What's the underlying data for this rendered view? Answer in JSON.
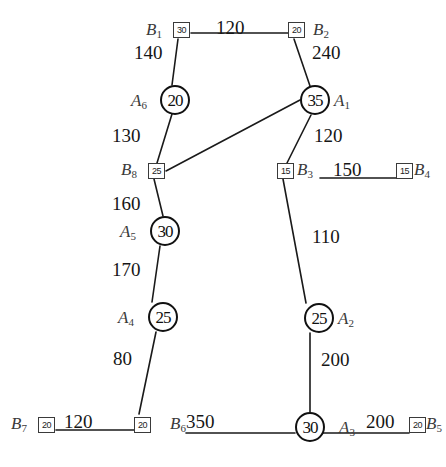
{
  "diagram": {
    "background_color": "#ffffff",
    "stroke_color": "#1a1a1a",
    "nodes": [
      {
        "id": "B1",
        "shape": "square",
        "label": "B",
        "sub": "1",
        "value": "30",
        "x": 173,
        "y": 22,
        "label_x": 146,
        "label_y": 21,
        "label_side": "left"
      },
      {
        "id": "B2",
        "shape": "square",
        "label": "B",
        "sub": "2",
        "value": "20",
        "x": 288,
        "y": 22,
        "label_x": 313,
        "label_y": 21,
        "label_side": "right"
      },
      {
        "id": "A6",
        "shape": "circle",
        "label": "A",
        "sub": "6",
        "value": "20",
        "x": 160,
        "y": 85,
        "label_x": 131,
        "label_y": 92,
        "label_side": "left"
      },
      {
        "id": "A1",
        "shape": "circle",
        "label": "A",
        "sub": "1",
        "value": "35",
        "x": 300,
        "y": 85,
        "label_x": 334,
        "label_y": 92,
        "label_side": "right"
      },
      {
        "id": "B8",
        "shape": "square",
        "label": "B",
        "sub": "8",
        "value": "25",
        "x": 148,
        "y": 163,
        "label_x": 121,
        "label_y": 161,
        "label_side": "left"
      },
      {
        "id": "B3",
        "shape": "square",
        "label": "B",
        "sub": "3",
        "value": "15",
        "x": 277,
        "y": 163,
        "label_x": 297,
        "label_y": 161,
        "label_side": "right"
      },
      {
        "id": "B4",
        "shape": "square",
        "label": "B",
        "sub": "4",
        "value": "15",
        "x": 396,
        "y": 163,
        "label_x": 414,
        "label_y": 161,
        "label_side": "right"
      },
      {
        "id": "A5",
        "shape": "circle",
        "label": "A",
        "sub": "5",
        "value": "30",
        "x": 150,
        "y": 216,
        "label_x": 120,
        "label_y": 223,
        "label_side": "left"
      },
      {
        "id": "A2",
        "shape": "circle",
        "label": "A",
        "sub": "2",
        "value": "25",
        "x": 304,
        "y": 303,
        "label_x": 338,
        "label_y": 310,
        "label_side": "right"
      },
      {
        "id": "A4",
        "shape": "circle",
        "label": "A",
        "sub": "4",
        "value": "25",
        "x": 148,
        "y": 302,
        "label_x": 118,
        "label_y": 309,
        "label_side": "left"
      },
      {
        "id": "B7",
        "shape": "square",
        "label": "B",
        "sub": "7",
        "value": "20",
        "x": 38,
        "y": 417,
        "label_x": 11,
        "label_y": 415,
        "label_side": "left"
      },
      {
        "id": "B6",
        "shape": "square",
        "label": "B",
        "sub": "6",
        "value": "20",
        "x": 134,
        "y": 417,
        "label_x": 170,
        "label_y": 415,
        "label_side": "right"
      },
      {
        "id": "A3",
        "shape": "circle",
        "label": "A",
        "sub": "3",
        "value": "30",
        "x": 295,
        "y": 412,
        "label_x": 339,
        "label_y": 419,
        "label_side": "right"
      },
      {
        "id": "B5",
        "shape": "square",
        "label": "B",
        "sub": "5",
        "value": "20",
        "x": 409,
        "y": 417,
        "label_x": 426,
        "label_y": 415,
        "label_side": "right"
      }
    ],
    "edges": [
      {
        "from": "B1",
        "to": "B2",
        "weight": "120",
        "x1": 191,
        "y1": 33,
        "x2": 288,
        "y2": 33,
        "wx": 216,
        "wy": 18,
        "style": "solid"
      },
      {
        "from": "B1",
        "to": "A6",
        "weight": "140",
        "x1": 178,
        "y1": 39,
        "x2": 172,
        "y2": 85,
        "wx": 134,
        "wy": 43,
        "style": "solid"
      },
      {
        "from": "B2",
        "to": "A1",
        "weight": "240",
        "x1": 294,
        "y1": 39,
        "x2": 310,
        "y2": 86,
        "wx": 312,
        "wy": 43,
        "style": "solid"
      },
      {
        "from": "A6",
        "to": "B8",
        "weight": "130",
        "x1": 172,
        "y1": 114,
        "x2": 157,
        "y2": 163,
        "wx": 112,
        "wy": 126,
        "style": "solid"
      },
      {
        "from": "A1",
        "to": "B8",
        "weight": "",
        "x1": 300,
        "y1": 100,
        "x2": 166,
        "y2": 171,
        "wx": 0,
        "wy": 0,
        "style": "solid"
      },
      {
        "from": "A1",
        "to": "B3",
        "weight": "120",
        "x1": 311,
        "y1": 115,
        "x2": 287,
        "y2": 163,
        "wx": 314,
        "wy": 126,
        "style": "solid"
      },
      {
        "from": "B3",
        "to": "B4",
        "weight": "150",
        "x1": 320,
        "y1": 178,
        "x2": 396,
        "y2": 178,
        "wx": 333,
        "wy": 160,
        "style": "solid"
      },
      {
        "from": "B8",
        "to": "A5",
        "weight": "160",
        "x1": 154,
        "y1": 179,
        "x2": 163,
        "y2": 216,
        "wx": 112,
        "wy": 194,
        "style": "solid"
      },
      {
        "from": "A5",
        "to": "A4",
        "weight": "170",
        "x1": 160,
        "y1": 246,
        "x2": 152,
        "y2": 302,
        "wx": 112,
        "wy": 260,
        "style": "solid"
      },
      {
        "from": "B3",
        "to": "A2",
        "weight": "110",
        "x1": 283,
        "y1": 179,
        "x2": 306,
        "y2": 303,
        "wx": 312,
        "wy": 227,
        "style": "solid"
      },
      {
        "from": "A4",
        "to": "B6",
        "weight": "80",
        "x1": 156,
        "y1": 332,
        "x2": 139,
        "y2": 414,
        "wx": 113,
        "wy": 349,
        "style": "solid"
      },
      {
        "from": "A2",
        "to": "A3",
        "weight": "200",
        "x1": 310,
        "y1": 333,
        "x2": 310,
        "y2": 412,
        "wx": 321,
        "wy": 350,
        "style": "solid"
      },
      {
        "from": "B7",
        "to": "B6",
        "weight": "120",
        "x1": 56,
        "y1": 430,
        "x2": 134,
        "y2": 430,
        "wx": 64,
        "wy": 412,
        "style": "solid"
      },
      {
        "from": "B6",
        "to": "A3",
        "weight": "350",
        "x1": 186,
        "y1": 433,
        "x2": 295,
        "y2": 433,
        "wx": 186,
        "wy": 412,
        "style": "solid"
      },
      {
        "from": "A3",
        "to": "B5",
        "weight": "200",
        "x1": 322,
        "y1": 433,
        "x2": 409,
        "y2": 433,
        "wx": 366,
        "wy": 412,
        "style": "solid"
      }
    ]
  }
}
